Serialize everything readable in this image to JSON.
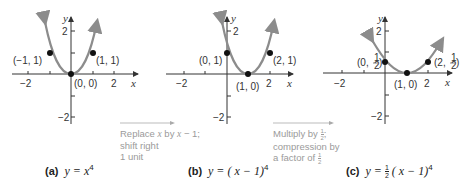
{
  "graphs": [
    {
      "id": "a",
      "caption_letter": "(a)",
      "caption_eq_prefix": "y = ",
      "caption_eq_body": "x",
      "caption_exp": "4",
      "x_tick_labels": [
        "−2",
        "2"
      ],
      "y_tick_labels": [
        "2",
        "−2"
      ],
      "axis_x": "x",
      "axis_y": "y",
      "points": [
        {
          "label": "(−1, 1)",
          "x": -1,
          "y": 1
        },
        {
          "label": "(0, 0)",
          "x": 0,
          "y": 0
        },
        {
          "label": "(1, 1)",
          "x": 1,
          "y": 1
        }
      ]
    },
    {
      "id": "b",
      "caption_letter": "(b)",
      "caption_eq_prefix": "y = ( ",
      "caption_eq_body": "x − 1)",
      "caption_exp": "4",
      "x_tick_labels": [
        "−2",
        "2"
      ],
      "y_tick_labels": [
        "2",
        "−2"
      ],
      "axis_x": "x",
      "axis_y": "y",
      "points": [
        {
          "label": "(0, 1)",
          "x": 0,
          "y": 1
        },
        {
          "label": "(1, 0)",
          "x": 1,
          "y": 0
        },
        {
          "label": "(2, 1)",
          "x": 2,
          "y": 1
        }
      ]
    },
    {
      "id": "c",
      "caption_letter": "(c)",
      "caption_eq_prefix": "y = ",
      "caption_frac_num": "1",
      "caption_frac_den": "2",
      "caption_eq_body": " ( x − 1)",
      "caption_exp": "4",
      "x_tick_labels": [
        "−2",
        "2"
      ],
      "y_tick_labels": [
        "2",
        "−2"
      ],
      "axis_x": "x",
      "axis_y": "y",
      "points": [
        {
          "label": "(0, 1/2)",
          "x": 0,
          "y": 0.5
        },
        {
          "label": "(1, 0)",
          "x": 1,
          "y": 0
        },
        {
          "label": "(2, 1/2)",
          "x": 2,
          "y": 0.5
        }
      ]
    }
  ],
  "transitions": [
    {
      "line1_a": "Replace ",
      "line1_var1": "x",
      "line1_b": " by ",
      "line1_var2": "x",
      "line1_c": " − 1;",
      "line2": "shift right",
      "line3": "1 unit"
    },
    {
      "line1": "Multiply by ",
      "frac_num": "1",
      "frac_den": "2",
      "line1_end": ";",
      "line2": "compression by",
      "line3": "a factor of ",
      "frac2_num": "1",
      "frac2_den": "2"
    }
  ],
  "colors": {
    "curve": "#8c8c8c",
    "axis": "#333333",
    "point": "#111111",
    "note_text": "#9a9a9a"
  }
}
